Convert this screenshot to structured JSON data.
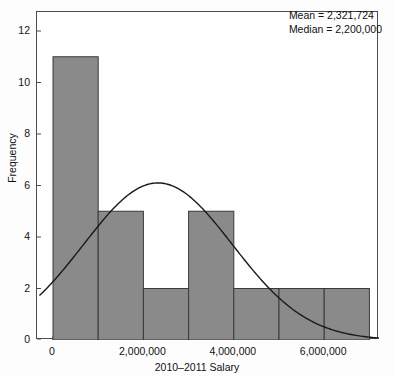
{
  "chart_data": {
    "type": "bar",
    "title": "",
    "subtitle": "",
    "xlabel": "2010–2011 Salary",
    "ylabel": "Frequency",
    "xlim": [
      -300000,
      7600000
    ],
    "ylim": [
      0,
      12.6
    ],
    "grid": false,
    "legend": null,
    "bin_width": 1000000,
    "bin_edges": [
      0,
      1000000,
      2000000,
      3000000,
      4000000,
      5000000,
      6000000,
      7000000
    ],
    "categories": [
      "0–1,000,000",
      "1,000,000–2,000,000",
      "2,000,000–3,000,000",
      "3,000,000–4,000,000",
      "4,000,000–5,000,000",
      "5,000,000–6,000,000",
      "6,000,000–7,000,000"
    ],
    "values": [
      11,
      5,
      2,
      5,
      2,
      2,
      2
    ],
    "xticks": [
      0,
      2000000,
      4000000,
      6000000
    ],
    "xtick_labels": [
      "0",
      "2,000,000",
      "4,000,000",
      "6,000,000"
    ],
    "yticks": [
      0,
      2,
      4,
      6,
      8,
      10,
      12
    ],
    "ytick_labels": [
      "0",
      "2",
      "4",
      "6",
      "8",
      "10",
      "12"
    ],
    "overlay_curve": {
      "type": "normal-density",
      "name": "normal curve",
      "peak_x": 2321724,
      "peak_y": 6.1,
      "mean": 2321724,
      "sd": 1650000,
      "scale_n_times_binwidth": 29
    },
    "annotations": [
      "Mean = 2,321,724",
      "Median = 2,200,000"
    ],
    "stats": {
      "mean": "2,321,724",
      "median": "2,200,000",
      "mean_label": "Mean = 2,321,724",
      "median_label": "Median = 2,200,000"
    },
    "colors": {
      "bar_fill": "#8a8a8a",
      "bar_edge": "#3a3a3a",
      "curve": "#1a1a1a",
      "frame": "#4d4d4d",
      "text": "#111111",
      "background": "#fdfdfd"
    }
  }
}
